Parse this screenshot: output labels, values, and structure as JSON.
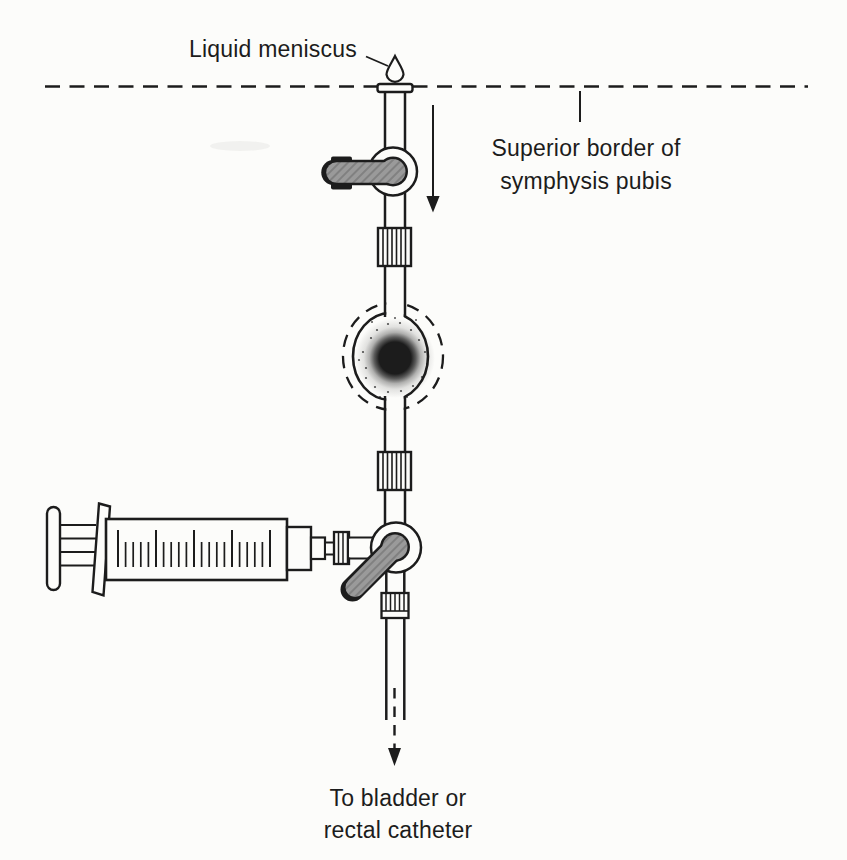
{
  "figure": {
    "colors": {
      "paper": "#fcfcfa",
      "ink": "#1c1c1c",
      "handle_gray": "#9a9a9a",
      "handle_hatch": "#7a7a7a"
    },
    "labels": {
      "liquid_meniscus": "Liquid meniscus",
      "superior_border_line1": "Superior border of",
      "superior_border_line2": "symphysis pubis",
      "catheter_line1": "To bladder or",
      "catheter_line2": "rectal catheter"
    }
  }
}
